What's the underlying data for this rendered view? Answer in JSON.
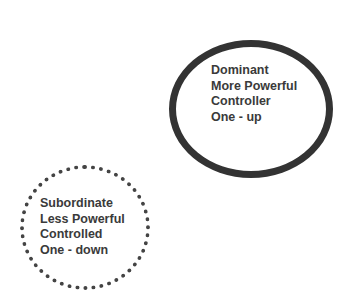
{
  "diagram": {
    "dominant": {
      "border_style": "solid",
      "lines": [
        "Dominant",
        "More Powerful",
        "Controller",
        "One - up"
      ]
    },
    "subordinate": {
      "border_style": "dotted",
      "lines": [
        "Subordinate",
        "Less Powerful",
        "Controlled",
        "One - down"
      ]
    },
    "colors": {
      "stroke": "#333333",
      "text": "#3a3a3a",
      "background": "#ffffff"
    }
  }
}
